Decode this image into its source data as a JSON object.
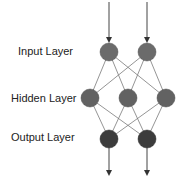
{
  "diagram": {
    "labels": {
      "input": "Input Layer",
      "hidden": "Hidden Layer",
      "output": "Output Layer"
    },
    "layers": [
      {
        "name": "input",
        "nodes": 2,
        "color": "#6b6b6b"
      },
      {
        "name": "hidden",
        "nodes": 3,
        "color": "#626262"
      },
      {
        "name": "output",
        "nodes": 2,
        "color": "#3c3c3c"
      }
    ],
    "edge_color": "#7a7a7a"
  }
}
